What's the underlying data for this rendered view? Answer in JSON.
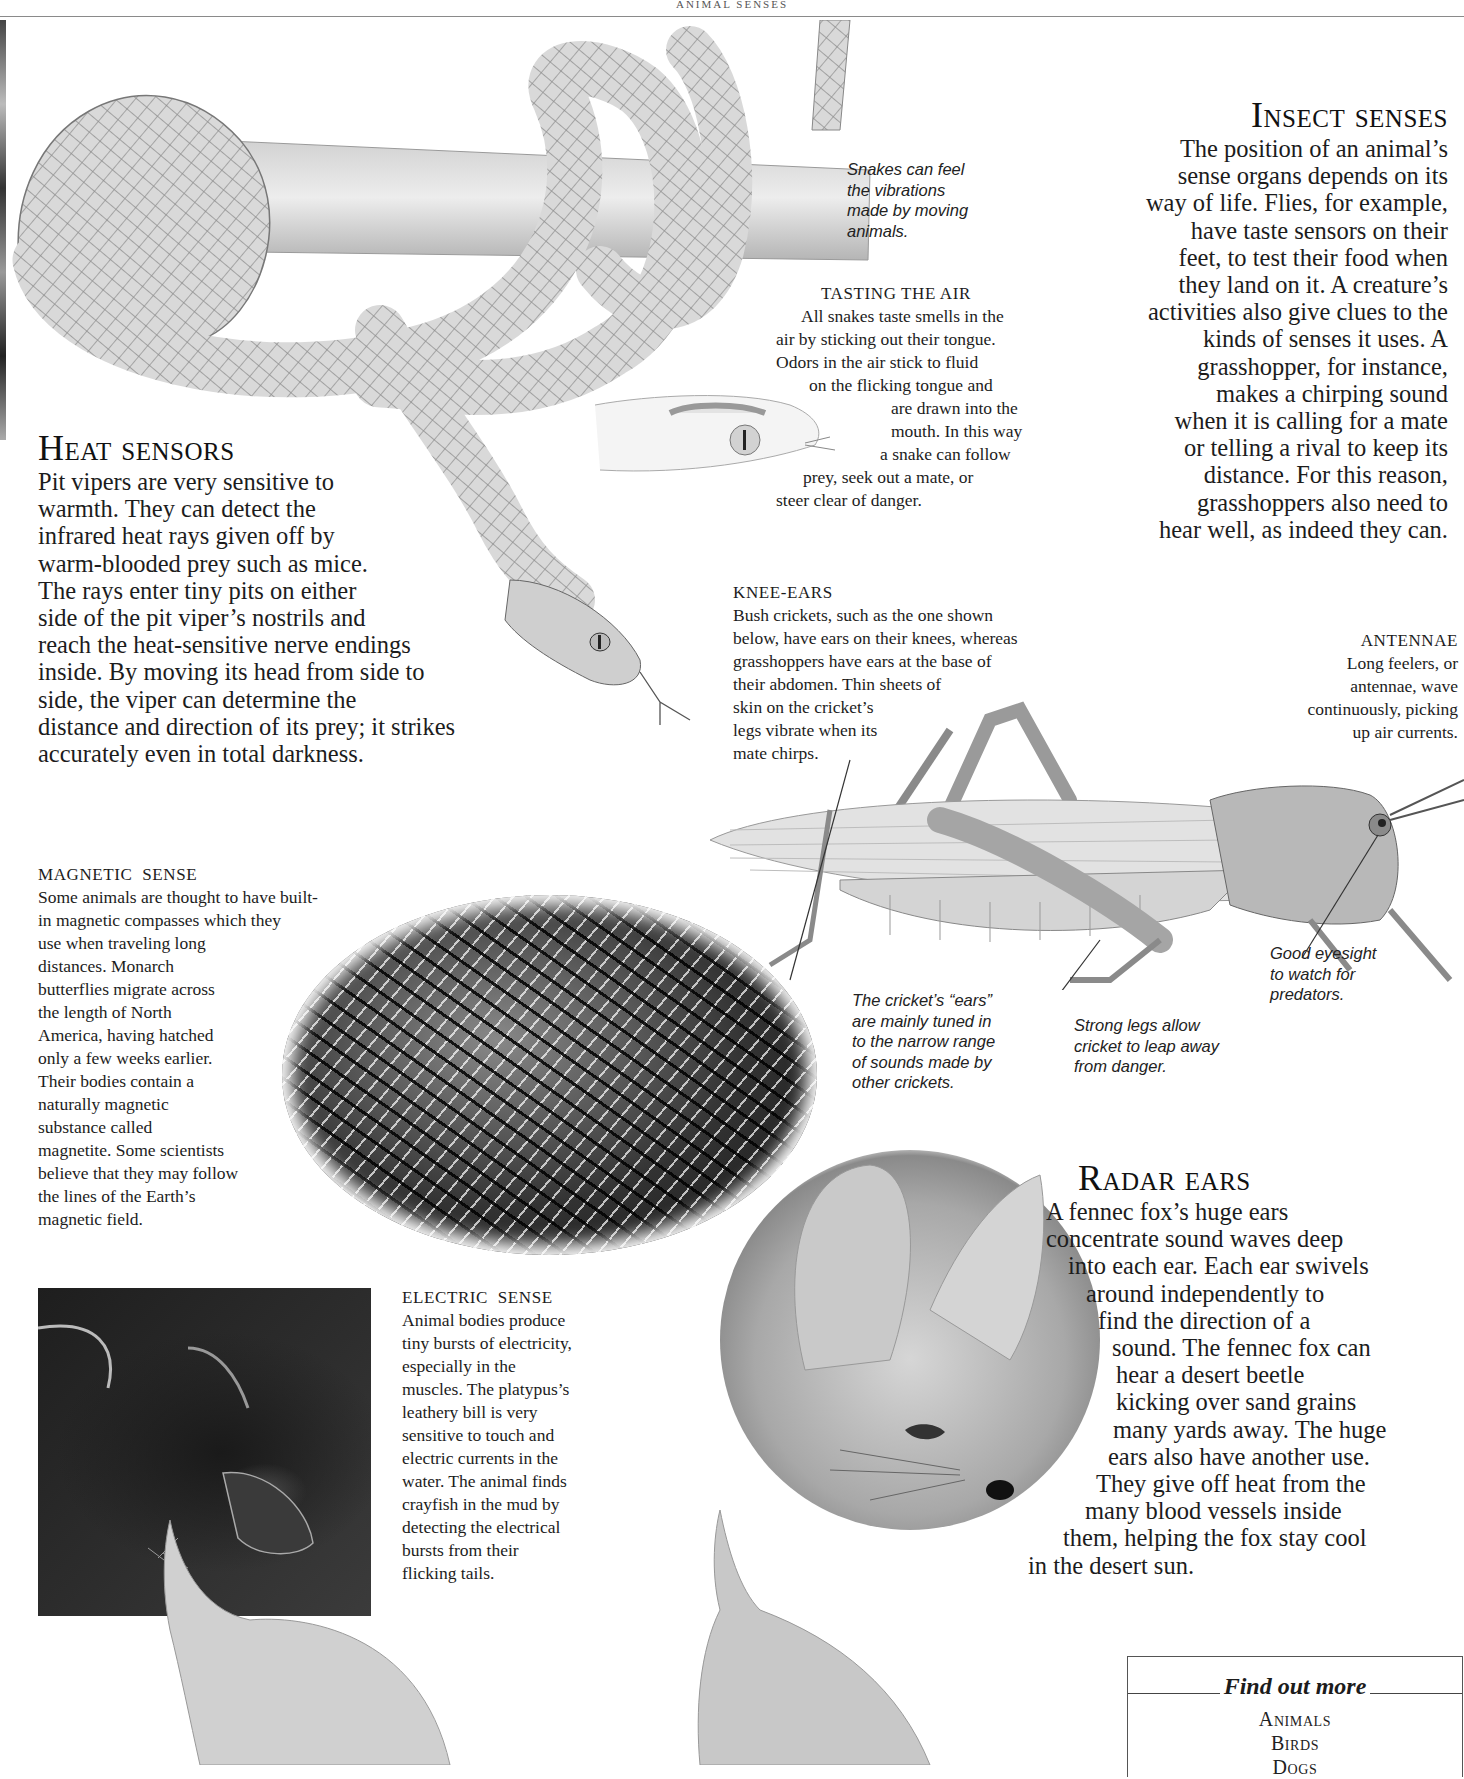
{
  "page": {
    "running_head": "ANIMAL SENSES"
  },
  "illustrations": {
    "snake": "snake-coiled-on-branch-illustration",
    "snake_head": "snake-head-tongue-illustration",
    "grasshopper": "grasshopper-illustration",
    "butterflies": "monarch-butterflies-photo",
    "platypus": "platypus-photo",
    "fox": "fennec-fox-photo",
    "dogs": "dogs-illustration"
  },
  "captions": {
    "snake_vibrations": [
      "Snakes can feel",
      "the vibrations",
      "made by moving",
      "animals."
    ],
    "cricket_ears": [
      "The cricket’s “ears”",
      "are mainly tuned in",
      "to the narrow range",
      "of sounds made by",
      "other crickets."
    ],
    "strong_legs": [
      "Strong legs allow",
      "cricket to leap away",
      "from danger."
    ],
    "good_eyesight": [
      "Good eyesight",
      "to watch for",
      "predators."
    ]
  },
  "sections": {
    "insect_senses": {
      "title": "Insect senses",
      "lines": [
        "The position of an animal’s",
        "sense organs depends on its",
        "way of life. Flies, for example,",
        "have taste sensors on their",
        "feet, to test their food when",
        "they land on it. A creature’s",
        "activities also give clues to the",
        "kinds of senses it uses. A",
        "grasshopper, for instance,",
        "makes a chirping sound",
        "when it is calling for a mate",
        "or telling a rival to keep its",
        "distance. For this reason,",
        "grasshoppers also need to",
        "hear well, as indeed they can."
      ]
    },
    "tasting_the_air": {
      "title": "TASTING THE AIR",
      "lines": [
        "All snakes taste smells in the",
        "air by sticking out their tongue.",
        "Odors in the air stick to fluid",
        "on the flicking tongue and",
        "are drawn into the",
        "mouth. In this way",
        "a snake can follow",
        "prey, seek out a mate, or",
        "steer clear of danger."
      ]
    },
    "heat_sensors": {
      "title": "Heat sensors",
      "lines": [
        "Pit vipers are very sensitive to",
        "warmth. They can detect the",
        "infrared heat rays given off by",
        "warm-blooded prey such as mice.",
        "The rays enter tiny pits on either",
        "side of the pit viper’s nostrils and",
        "reach the heat-sensitive nerve endings",
        "inside. By moving its head from side to",
        "side, the viper can determine the",
        "distance and direction of its prey; it strikes",
        "accurately even in total darkness."
      ]
    },
    "knee_ears": {
      "title": "KNEE-EARS",
      "lines": [
        "Bush crickets, such as the one shown",
        "below, have ears on their knees, whereas",
        "grasshoppers have ears at the base of",
        "their abdomen. Thin sheets of",
        "skin on the cricket’s",
        "legs vibrate when its",
        "mate chirps."
      ]
    },
    "antennae": {
      "title": "ANTENNAE",
      "lines": [
        "Long feelers, or",
        "antennae, wave",
        "continuously, picking",
        "up air currents."
      ]
    },
    "magnetic_sense": {
      "title": "MAGNETIC  SENSE",
      "lines": [
        "Some animals are thought to have built-",
        "in magnetic compasses which they",
        "use when traveling long",
        "distances. Monarch",
        "butterflies migrate across",
        "the length of North",
        "America, having hatched",
        "only a few weeks earlier.",
        "Their bodies contain a",
        "naturally magnetic",
        "substance called",
        "magnetite. Some scientists",
        "believe that they may follow",
        "the lines of the Earth’s",
        "magnetic field."
      ]
    },
    "electric_sense": {
      "title": "ELECTRIC  SENSE",
      "lines": [
        "Animal bodies produce",
        "tiny bursts of electricity,",
        "especially in the",
        "muscles. The platypus’s",
        "leathery bill is very",
        "sensitive to touch and",
        "electric currents in the",
        "water. The animal finds",
        "crayfish in the mud by",
        "detecting the electrical",
        "bursts from their",
        "flicking tails."
      ]
    },
    "radar_ears": {
      "title": "Radar ears",
      "lines": [
        "A fennec fox’s huge ears",
        "concentrate sound waves deep",
        "into each ear. Each ear swivels",
        "around independently to",
        "find the direction of a",
        "sound. The fennec fox can",
        "hear a desert beetle",
        "kicking over sand grains",
        "many yards away. The huge",
        "ears also have another use.",
        "They give off heat from the",
        "many blood vessels inside",
        "them, helping the fox stay cool",
        "in the desert sun."
      ],
      "indents": [
        48,
        48,
        70,
        88,
        100,
        115,
        120,
        120,
        117,
        110,
        100,
        88,
        65,
        27
      ]
    }
  },
  "find_out_more": {
    "title": "Find out more",
    "items": [
      "Animals",
      "Birds",
      "Dogs"
    ]
  }
}
